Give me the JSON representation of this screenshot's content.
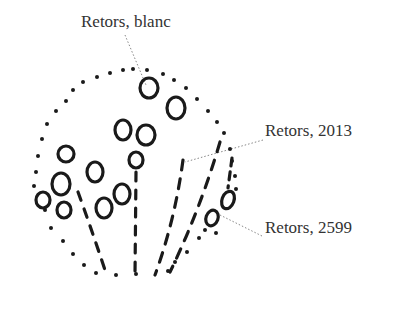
{
  "labels": {
    "top": "Retors, blanc",
    "middle": "Retors, 2013",
    "bottom": "Retors, 2599"
  },
  "colors": {
    "ink": "#1a1a1a",
    "text": "#333333",
    "leader": "#888888"
  }
}
